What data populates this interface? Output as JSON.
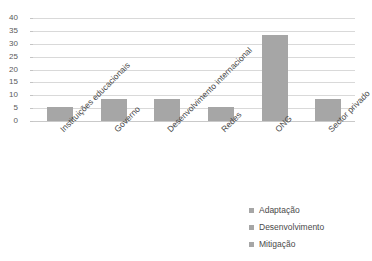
{
  "chart_data": {
    "type": "bar",
    "title": "",
    "subtitle": "",
    "xlabel": "",
    "ylabel": "",
    "ylim": [
      0,
      40
    ],
    "ytick_step": 5,
    "yticks": [
      40,
      35,
      30,
      25,
      20,
      15,
      10,
      5,
      0
    ],
    "grid": true,
    "legend_position": "bottom-right",
    "categories": [
      "Instituições educacionais",
      "Governo",
      "Desenvolvimento internacional",
      "Redes",
      "ONG",
      "Sector privado"
    ],
    "series": [
      {
        "name": "Adaptação",
        "color": "#a6a6a6",
        "values": [
          5.4,
          8.6,
          8.6,
          5.4,
          33.5,
          8.6
        ]
      }
    ],
    "legend_entries": [
      {
        "label": "Adaptação",
        "color": "#a6a6a6"
      },
      {
        "label": "Desenvolvimento",
        "color": "#a6a6a6"
      },
      {
        "label": "Mitigação",
        "color": "#a6a6a6"
      }
    ]
  },
  "colors": {
    "bar": "#a6a6a6",
    "gridline": "#d9d9d9",
    "baseline": "#c9c9c9",
    "text": "#4a4a4a",
    "background": "#ffffff"
  },
  "axis": {
    "y_tick_0": "0",
    "y_tick_5": "5",
    "y_tick_10": "10",
    "y_tick_15": "15",
    "y_tick_20": "20",
    "y_tick_25": "25",
    "y_tick_30": "30",
    "y_tick_35": "35",
    "y_tick_40": "40"
  },
  "categories_text": {
    "cat_0": "Instituições educacionais",
    "cat_1": "Governo",
    "cat_2": "Desenvolvimento internacional",
    "cat_3": "Redes",
    "cat_4": "ONG",
    "cat_5": "Sector privado"
  },
  "legend_text": {
    "item_0": "Adaptação",
    "item_1": "Desenvolvimento",
    "item_2": "Mitigação"
  }
}
